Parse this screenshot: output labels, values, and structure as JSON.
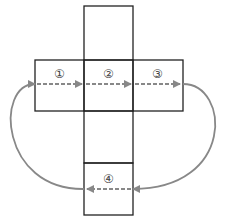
{
  "diagram": {
    "type": "cube-net",
    "labels": {
      "face1": "①",
      "face2": "②",
      "face3": "③",
      "face4": "④"
    },
    "colors": {
      "line": "#222222",
      "arrow": "#888888",
      "label": "#444444"
    }
  }
}
